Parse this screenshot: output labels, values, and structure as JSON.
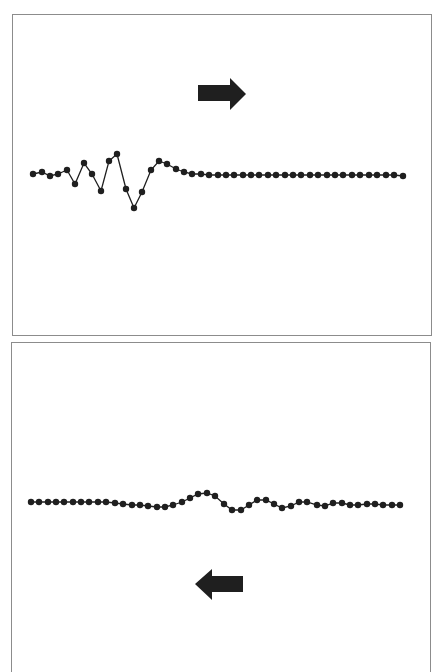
{
  "figure": {
    "panels": [
      {
        "id": "top",
        "arrow_direction": "right",
        "description": "Wave pulse on a chain of particles traveling to the right",
        "points": [
          [
            33,
            174
          ],
          [
            42,
            172
          ],
          [
            50,
            176
          ],
          [
            58,
            174
          ],
          [
            67,
            170
          ],
          [
            75,
            184
          ],
          [
            84,
            163
          ],
          [
            92,
            174
          ],
          [
            101,
            191
          ],
          [
            109,
            161
          ],
          [
            117,
            154
          ],
          [
            126,
            189
          ],
          [
            134,
            208
          ],
          [
            142,
            192
          ],
          [
            151,
            170
          ],
          [
            159,
            161
          ],
          [
            167,
            164
          ],
          [
            176,
            169
          ],
          [
            184,
            172
          ],
          [
            192,
            174
          ],
          [
            201,
            174
          ],
          [
            209,
            175
          ],
          [
            218,
            175
          ],
          [
            226,
            175
          ],
          [
            234,
            175
          ],
          [
            243,
            175
          ],
          [
            251,
            175
          ],
          [
            259,
            175
          ],
          [
            268,
            175
          ],
          [
            276,
            175
          ],
          [
            285,
            175
          ],
          [
            293,
            175
          ],
          [
            301,
            175
          ],
          [
            310,
            175
          ],
          [
            318,
            175
          ],
          [
            327,
            175
          ],
          [
            335,
            175
          ],
          [
            343,
            175
          ],
          [
            352,
            175
          ],
          [
            360,
            175
          ],
          [
            369,
            175
          ],
          [
            377,
            175
          ],
          [
            386,
            175
          ],
          [
            394,
            175
          ],
          [
            403,
            176
          ]
        ]
      },
      {
        "id": "bottom",
        "arrow_direction": "left",
        "description": "Reflected wave pulse on a chain of particles traveling to the left",
        "points": [
          [
            31,
            502
          ],
          [
            39,
            502
          ],
          [
            48,
            502
          ],
          [
            56,
            502
          ],
          [
            64,
            502
          ],
          [
            73,
            502
          ],
          [
            81,
            502
          ],
          [
            89,
            502
          ],
          [
            98,
            502
          ],
          [
            106,
            502
          ],
          [
            115,
            503
          ],
          [
            123,
            504
          ],
          [
            132,
            505
          ],
          [
            140,
            505
          ],
          [
            148,
            506
          ],
          [
            157,
            507
          ],
          [
            165,
            507
          ],
          [
            173,
            505
          ],
          [
            182,
            502
          ],
          [
            190,
            498
          ],
          [
            198,
            494
          ],
          [
            207,
            493
          ],
          [
            215,
            496
          ],
          [
            224,
            504
          ],
          [
            232,
            510
          ],
          [
            241,
            510
          ],
          [
            249,
            505
          ],
          [
            257,
            500
          ],
          [
            266,
            500
          ],
          [
            274,
            504
          ],
          [
            282,
            508
          ],
          [
            291,
            506
          ],
          [
            299,
            502
          ],
          [
            307,
            502
          ],
          [
            317,
            505
          ],
          [
            325,
            506
          ],
          [
            333,
            503
          ],
          [
            342,
            503
          ],
          [
            350,
            505
          ],
          [
            358,
            505
          ],
          [
            367,
            504
          ],
          [
            375,
            504
          ],
          [
            383,
            505
          ],
          [
            392,
            505
          ],
          [
            400,
            505
          ]
        ]
      }
    ],
    "colors": {
      "ink": "#1f1f1f",
      "border": "#8c8c8c",
      "background": "#ffffff"
    }
  }
}
